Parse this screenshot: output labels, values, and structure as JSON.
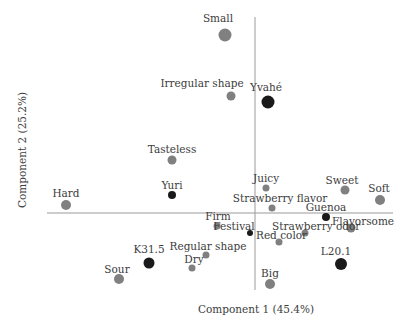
{
  "chart_data": {
    "type": "scatter",
    "subtype": "pca-biplot",
    "title": "",
    "xlabel": "Component 1 (45.4%)",
    "ylabel": "Component 2 (25.2%)",
    "grid": false,
    "legend": null,
    "axes": {
      "origin_px": [
        255,
        213
      ],
      "h_axis_px": {
        "x1": 47,
        "x2": 393,
        "y": 213
      },
      "v_axis_px": {
        "x": 255,
        "y1": 17,
        "y2": 290
      }
    },
    "colors": {
      "attribute": "#808080",
      "cultivar": "#1a1a1a",
      "axis": "#9a9a9a"
    },
    "points": [
      {
        "name": "Small",
        "group": "attribute",
        "x": 225,
        "y": 35,
        "r": 6.5,
        "lx": 218,
        "ly": 13,
        "anchor": "middle"
      },
      {
        "name": "Irregular shape",
        "group": "attribute",
        "x": 231,
        "y": 96,
        "r": 4.5,
        "lx": 202,
        "ly": 78,
        "anchor": "middle"
      },
      {
        "name": "Yvahé",
        "group": "cultivar",
        "x": 268,
        "y": 102,
        "r": 6.5,
        "lx": 266,
        "ly": 82,
        "anchor": "middle"
      },
      {
        "name": "Tasteless",
        "group": "attribute",
        "x": 172,
        "y": 160,
        "r": 4.5,
        "lx": 172,
        "ly": 144,
        "anchor": "middle"
      },
      {
        "name": "Yuri",
        "group": "cultivar",
        "x": 172,
        "y": 195,
        "r": 4,
        "lx": 172,
        "ly": 180,
        "anchor": "middle"
      },
      {
        "name": "Hard",
        "group": "attribute",
        "x": 66,
        "y": 205,
        "r": 5,
        "lx": 66,
        "ly": 188,
        "anchor": "middle"
      },
      {
        "name": "Juicy",
        "group": "attribute",
        "x": 266,
        "y": 188,
        "r": 3.5,
        "lx": 266,
        "ly": 173,
        "anchor": "middle"
      },
      {
        "name": "Strawberry flavor",
        "group": "attribute",
        "x": 272,
        "y": 208,
        "r": 3.5,
        "lx": 280,
        "ly": 193,
        "anchor": "middle"
      },
      {
        "name": "Sweet",
        "group": "attribute",
        "x": 345,
        "y": 190,
        "r": 4.5,
        "lx": 342,
        "ly": 175,
        "anchor": "middle"
      },
      {
        "name": "Soft",
        "group": "attribute",
        "x": 380,
        "y": 200,
        "r": 5,
        "lx": 379,
        "ly": 183,
        "anchor": "middle"
      },
      {
        "name": "Guenoa",
        "group": "cultivar",
        "x": 326,
        "y": 217,
        "r": 4,
        "lx": 326,
        "ly": 202,
        "anchor": "middle"
      },
      {
        "name": "Flavorsome",
        "group": "attribute",
        "x": 351,
        "y": 228,
        "r": 4.5,
        "lx": 332,
        "ly": 216,
        "anchor": "start"
      },
      {
        "name": "Firm",
        "group": "attribute",
        "x": 217,
        "y": 226,
        "r": 3.5,
        "lx": 218,
        "ly": 211,
        "anchor": "middle"
      },
      {
        "name": "Festival",
        "group": "cultivar",
        "x": 250,
        "y": 233,
        "r": 3,
        "lx": 234,
        "ly": 221,
        "anchor": "middle"
      },
      {
        "name": "Strawberry odor",
        "group": "attribute",
        "x": 305,
        "y": 233,
        "r": 3.5,
        "lx": 272,
        "ly": 221,
        "anchor": "start"
      },
      {
        "name": "Red color",
        "group": "attribute",
        "x": 279,
        "y": 242,
        "r": 3.5,
        "lx": 256,
        "ly": 230,
        "anchor": "start"
      },
      {
        "name": "Regular shape",
        "group": "attribute",
        "x": 206,
        "y": 255,
        "r": 3.5,
        "lx": 208,
        "ly": 241,
        "anchor": "middle"
      },
      {
        "name": "Dry",
        "group": "attribute",
        "x": 192,
        "y": 268,
        "r": 3.5,
        "lx": 194,
        "ly": 254,
        "anchor": "middle"
      },
      {
        "name": "K31.5",
        "group": "cultivar",
        "x": 149,
        "y": 263,
        "r": 5.5,
        "lx": 149,
        "ly": 244,
        "anchor": "middle"
      },
      {
        "name": "Sour",
        "group": "attribute",
        "x": 119,
        "y": 279,
        "r": 5,
        "lx": 117,
        "ly": 264,
        "anchor": "middle"
      },
      {
        "name": "L20.1",
        "group": "cultivar",
        "x": 341,
        "y": 264,
        "r": 6,
        "lx": 336,
        "ly": 246,
        "anchor": "middle"
      },
      {
        "name": "Big",
        "group": "attribute",
        "x": 270,
        "y": 284,
        "r": 5,
        "lx": 270,
        "ly": 268,
        "anchor": "middle"
      }
    ]
  }
}
